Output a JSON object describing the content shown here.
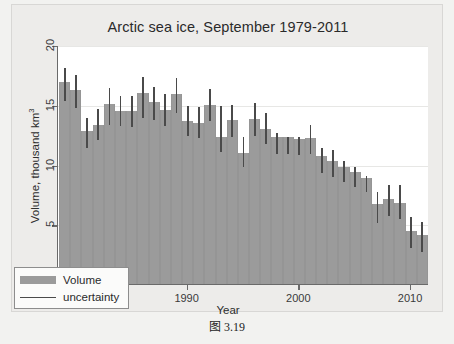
{
  "figure": {
    "caption": "图 3.19"
  },
  "chart_data": {
    "type": "bar",
    "title": "Arctic sea ice, September 1979-2011",
    "xlabel": "Year",
    "ylabel": "Volume, thousand km",
    "ylabel_exponent": "3",
    "ylim": [
      0,
      20
    ],
    "xlim": [
      1978.4,
      2011.6
    ],
    "yticks": [
      0,
      5,
      10,
      15,
      20
    ],
    "ytick_labels": [
      "0",
      "5",
      "10",
      "15",
      "20"
    ],
    "xticks": [
      1980,
      1990,
      2000,
      2010
    ],
    "xtick_labels": [
      "1980",
      "1990",
      "2000",
      "2010"
    ],
    "grid": true,
    "legend_position": "lower left",
    "legend": [
      {
        "label": "Volume",
        "marker": "bar",
        "color": "#9b9b9b"
      },
      {
        "label": "uncertainty",
        "marker": "line",
        "color": "#4a4a4a"
      }
    ],
    "categories": [
      1979,
      1980,
      1981,
      1982,
      1983,
      1984,
      1985,
      1986,
      1987,
      1988,
      1989,
      1990,
      1991,
      1992,
      1993,
      1994,
      1995,
      1996,
      1997,
      1998,
      1999,
      2000,
      2001,
      2002,
      2003,
      2004,
      2005,
      2006,
      2007,
      2008,
      2009,
      2010,
      2011
    ],
    "series": [
      {
        "name": "Volume",
        "values": [
          16.9,
          16.2,
          12.8,
          13.3,
          15.1,
          14.5,
          14.5,
          16.0,
          15.2,
          14.6,
          15.9,
          13.6,
          13.5,
          15.0,
          12.3,
          13.7,
          11.0,
          13.8,
          13.0,
          12.3,
          12.3,
          12.1,
          12.2,
          10.7,
          10.3,
          9.8,
          9.4,
          8.9,
          6.7,
          7.1,
          6.8,
          4.4,
          4.1
        ]
      },
      {
        "name": "uncertainty",
        "lower": [
          15.4,
          14.8,
          11.5,
          12.1,
          13.4,
          13.3,
          13.2,
          14.0,
          13.8,
          13.3,
          14.4,
          12.5,
          12.3,
          13.7,
          11.1,
          12.4,
          9.9,
          12.5,
          11.8,
          11.0,
          11.0,
          10.9,
          11.0,
          9.4,
          9.0,
          8.6,
          8.2,
          7.8,
          5.2,
          5.8,
          5.5,
          3.1,
          2.8
        ],
        "upper": [
          18.2,
          17.6,
          14.0,
          14.7,
          16.5,
          15.8,
          15.8,
          17.4,
          16.6,
          16.0,
          17.3,
          15.0,
          14.9,
          16.4,
          15.0,
          15.1,
          12.4,
          15.2,
          14.4,
          12.7,
          12.4,
          12.4,
          13.4,
          11.5,
          11.3,
          10.4,
          9.9,
          9.1,
          7.8,
          8.4,
          8.4,
          5.7,
          5.3
        ]
      }
    ]
  }
}
